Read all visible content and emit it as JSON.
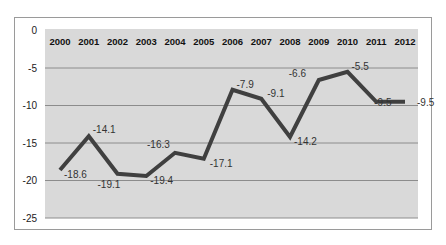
{
  "chart_data": {
    "type": "line",
    "title": "",
    "xlabel": "",
    "ylabel": "",
    "categories": [
      "2000",
      "2001",
      "2002",
      "2003",
      "2004",
      "2005",
      "2006",
      "2007",
      "2008",
      "2009",
      "2010",
      "2011",
      "2012"
    ],
    "series": [
      {
        "name": "Series 1",
        "values": [
          -18.6,
          -14.1,
          -19.1,
          -19.4,
          -16.3,
          -17.1,
          -7.9,
          -9.1,
          -14.2,
          -6.6,
          -5.5,
          -9.5,
          -9.5
        ],
        "labels": [
          "-18.6",
          "-14.1",
          "-19.1",
          "-19.4",
          "-16.3",
          "-17.1",
          "-7.9",
          "-9.1",
          "-14.2",
          "-6.6",
          "-5.5",
          "-9.5",
          "-9.5"
        ]
      }
    ],
    "ylim": [
      -25,
      0
    ],
    "yticks": [
      0,
      -5,
      -10,
      -15,
      -20,
      -25
    ],
    "ytick_labels": [
      "0",
      "-5",
      "-10",
      "-15",
      "-20",
      "-25"
    ],
    "x_axis_position": "top",
    "grid": true,
    "legend": "none"
  },
  "style": {
    "plot_bg": "#d9d9d9",
    "grid_color": "#8c8c8c",
    "line_color": "#404040",
    "frame_color": "#9a9a9a"
  }
}
